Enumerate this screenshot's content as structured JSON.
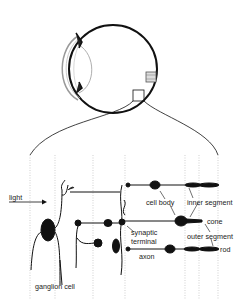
{
  "diagram": {
    "labels": {
      "light": "light",
      "ganglion_cell": "ganglion cell",
      "cell_body": "cell body",
      "inner_segment": "inner segment",
      "cone": "cone",
      "synaptic_terminal": "synaptic terminal",
      "synaptic_line1": "synaptic",
      "synaptic_line2": "terminal",
      "outer_segment": "outer segment",
      "axon": "axon",
      "rod": "rod"
    },
    "colors": {
      "ink": "#111111",
      "guide": "#bbbbbb",
      "background": "#ffffff"
    }
  }
}
